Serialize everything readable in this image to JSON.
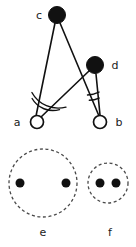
{
  "figure": {
    "canvas": {
      "width": 136,
      "height": 247
    },
    "background_color": "#ffffff",
    "ink_color": "#111111",
    "dash_color": "#4a4a4a"
  },
  "top_diagram": {
    "name": "angle-construction",
    "nodes": [
      {
        "id": "c",
        "label": "c",
        "type": "filled",
        "cx": 57,
        "cy": 15,
        "r": 8.5,
        "label_x": 39,
        "label_y": 16
      },
      {
        "id": "d",
        "label": "d",
        "type": "filled",
        "cx": 95,
        "cy": 65,
        "r": 8.5,
        "label_x": 115,
        "label_y": 66
      },
      {
        "id": "a",
        "label": "a",
        "type": "open",
        "cx": 37,
        "cy": 122,
        "r": 6.5,
        "label_x": 17,
        "label_y": 123
      },
      {
        "id": "b",
        "label": "b",
        "type": "open",
        "cx": 100,
        "cy": 122,
        "r": 6.5,
        "label_x": 119,
        "label_y": 123
      }
    ],
    "edges": [
      {
        "id": "c-a",
        "from": "c",
        "to": "a",
        "x1": 55,
        "y1": 23,
        "x2": 36,
        "y2": 116
      },
      {
        "id": "c-b",
        "from": "c",
        "to": "b",
        "x1": 60,
        "y1": 23,
        "x2": 99,
        "y2": 116
      },
      {
        "id": "d-a",
        "from": "d",
        "to": "a",
        "x1": 89,
        "y1": 71,
        "x2": 41,
        "y2": 117
      },
      {
        "id": "d-b",
        "from": "d",
        "to": "b",
        "x1": 96,
        "y1": 74,
        "x2": 100,
        "y2": 115
      }
    ],
    "angle_marks": [
      {
        "id": "angle-a-outer",
        "vertex": "a",
        "arc_count": 2,
        "radius": 30,
        "description": "double arc at vertex a between ac and ad"
      },
      {
        "id": "angle-a-inner",
        "vertex": "a",
        "arc_count": 2,
        "radius": 24,
        "description": "double arc at vertex a between ac and ad"
      },
      {
        "id": "angle-b-outer",
        "vertex": "b",
        "arc_count": 2,
        "radius": 30,
        "description": "double arc at vertex b between bc and bd"
      },
      {
        "id": "angle-b-inner",
        "vertex": "b",
        "arc_count": 2,
        "radius": 24,
        "description": "double arc at vertex b between bc and bd"
      }
    ]
  },
  "bottom_diagram": {
    "name": "dashed-circle-groups",
    "groups": [
      {
        "id": "e",
        "label": "e",
        "cx": 43,
        "cy": 183,
        "r": 34,
        "label_x": 43,
        "label_y": 233,
        "dots": [
          {
            "cx": 20,
            "cy": 183,
            "r": 4.5
          },
          {
            "cx": 66,
            "cy": 183,
            "r": 4.5
          }
        ]
      },
      {
        "id": "f",
        "label": "f",
        "cx": 108,
        "cy": 183,
        "r": 20,
        "label_x": 110,
        "label_y": 233,
        "dots": [
          {
            "cx": 100,
            "cy": 183,
            "r": 4.5
          },
          {
            "cx": 116,
            "cy": 183,
            "r": 4.5
          }
        ]
      }
    ]
  }
}
